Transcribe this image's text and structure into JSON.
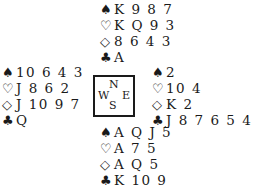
{
  "hands": {
    "north": {
      "spades": "K 9 8 7",
      "hearts": "K Q 9 3",
      "diamonds": "8 6 4 3",
      "clubs": "A"
    },
    "west": {
      "spades": "10 6 4 3",
      "hearts": "J 8 6 2",
      "diamonds": "J 10 9 7",
      "clubs": "Q"
    },
    "east": {
      "spades": "2",
      "hearts": "10 4",
      "diamonds": "K 2",
      "clubs": "J 8 7 6 5 4 3 2"
    },
    "south": {
      "spades": "A Q J 5",
      "hearts": "A 7 5",
      "diamonds": "A Q 5",
      "clubs": "K 10 9"
    }
  },
  "symbols": {
    "spades": "♠",
    "hearts": "♡",
    "diamonds": "◇",
    "clubs": "♣"
  },
  "compass": {
    "n": "N",
    "s": "S",
    "w": "W",
    "e": "E"
  }
}
